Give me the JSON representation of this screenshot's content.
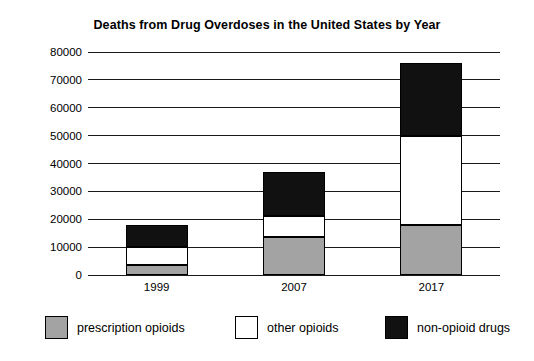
{
  "chart_data": {
    "type": "bar",
    "subtype": "stacked-bar",
    "title": "Deaths from Drug Overdoses in the United States by Year",
    "xlabel": "",
    "ylabel": "",
    "categories": [
      "1999",
      "2007",
      "2017"
    ],
    "series": [
      {
        "name": "prescription opioids",
        "values": [
          3500,
          13500,
          18000
        ],
        "color": "#a3a3a3"
      },
      {
        "name": "other opioids",
        "values": [
          6500,
          7500,
          32000
        ],
        "color": "#ffffff"
      },
      {
        "name": "non-opioid drugs",
        "values": [
          8000,
          16000,
          26000
        ],
        "color": "#111111"
      }
    ],
    "totals": [
      18000,
      37000,
      76000
    ],
    "ylim": [
      0,
      80000
    ],
    "ytick_values": [
      0,
      10000,
      20000,
      30000,
      40000,
      50000,
      60000,
      70000,
      80000
    ],
    "ytick_labels": [
      "0",
      "10000",
      "20000",
      "30000",
      "40000",
      "50000",
      "60000",
      "70000",
      "80000"
    ],
    "grid": true,
    "legend_position": "bottom"
  },
  "legend": {
    "items": [
      {
        "label": "prescription opioids",
        "swatch": "#a3a3a3"
      },
      {
        "label": "other opioids",
        "swatch": "#ffffff"
      },
      {
        "label": "non-opioid drugs",
        "swatch": "#111111"
      }
    ]
  }
}
